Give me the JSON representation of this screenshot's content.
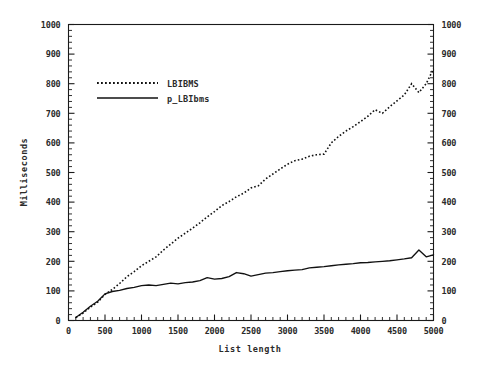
{
  "chart_data": {
    "type": "line",
    "title": "",
    "xlabel": "List length",
    "ylabel": "Milliseconds",
    "xlim": [
      0,
      5000
    ],
    "ylim": [
      0,
      1000
    ],
    "grid": false,
    "legend_position": "upper-left-inside",
    "x_ticks": [
      0,
      500,
      1000,
      1500,
      2000,
      2500,
      3000,
      3500,
      4000,
      4500,
      5000
    ],
    "x_tick_labels": [
      "0",
      "500",
      "1000",
      "1500",
      "2000",
      "2500",
      "3000",
      "3500",
      "4000",
      "4500",
      "5000"
    ],
    "x_minor_step": 100,
    "y_ticks": [
      0,
      100,
      200,
      300,
      400,
      500,
      600,
      700,
      800,
      900,
      1000
    ],
    "y_tick_labels": [
      "0",
      "100",
      "200",
      "300",
      "400",
      "500",
      "600",
      "700",
      "800",
      "900",
      "1000"
    ],
    "y_minor_step": 20,
    "right_axis_ticks": [
      0,
      100,
      200,
      300,
      400,
      500,
      600,
      700,
      800,
      900,
      1000
    ],
    "right_axis_tick_labels": [
      "0",
      "100",
      "200",
      "300",
      "400",
      "500",
      "600",
      "700",
      "800",
      "900",
      "1000"
    ],
    "series": [
      {
        "name": "LBIBMS",
        "style": "dotted",
        "color": "#111111",
        "x": [
          100,
          200,
          300,
          400,
          500,
          600,
          700,
          800,
          900,
          1000,
          1100,
          1200,
          1300,
          1400,
          1500,
          1600,
          1700,
          1800,
          1900,
          2000,
          2100,
          2200,
          2300,
          2400,
          2500,
          2600,
          2700,
          2800,
          2900,
          3000,
          3100,
          3200,
          3300,
          3400,
          3500,
          3600,
          3700,
          3800,
          3900,
          4000,
          4100,
          4200,
          4300,
          4400,
          4500,
          4600,
          4700,
          4800,
          4900,
          5000
        ],
        "y": [
          10,
          25,
          45,
          62,
          88,
          105,
          125,
          148,
          165,
          185,
          200,
          215,
          238,
          258,
          278,
          295,
          312,
          330,
          350,
          368,
          388,
          402,
          418,
          430,
          448,
          455,
          478,
          495,
          512,
          528,
          540,
          545,
          555,
          560,
          562,
          600,
          622,
          640,
          655,
          672,
          690,
          712,
          700,
          722,
          742,
          762,
          800,
          770,
          800,
          850
        ]
      },
      {
        "name": "p_LBIbms",
        "style": "solid",
        "color": "#111111",
        "x": [
          100,
          200,
          300,
          400,
          500,
          600,
          700,
          800,
          900,
          1000,
          1100,
          1200,
          1300,
          1400,
          1500,
          1600,
          1700,
          1800,
          1900,
          2000,
          2100,
          2200,
          2300,
          2400,
          2500,
          2600,
          2700,
          2800,
          2900,
          3000,
          3100,
          3200,
          3300,
          3400,
          3500,
          3600,
          3700,
          3800,
          3900,
          4000,
          4100,
          4200,
          4300,
          4400,
          4500,
          4600,
          4700,
          4800,
          4900,
          5000
        ],
        "y": [
          10,
          28,
          48,
          65,
          90,
          98,
          102,
          108,
          112,
          118,
          120,
          118,
          122,
          126,
          124,
          128,
          130,
          135,
          145,
          140,
          142,
          148,
          162,
          158,
          150,
          155,
          160,
          162,
          165,
          168,
          170,
          172,
          178,
          180,
          182,
          185,
          188,
          190,
          192,
          195,
          196,
          198,
          200,
          202,
          205,
          208,
          212,
          238,
          215,
          222
        ]
      }
    ]
  },
  "legend": {
    "entries": [
      {
        "label": "LBIBMS",
        "style": "dotted"
      },
      {
        "label": "p_LBIbms",
        "style": "solid"
      }
    ]
  }
}
